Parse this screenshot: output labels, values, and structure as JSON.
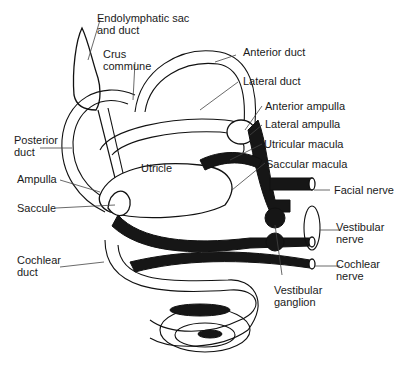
{
  "figure": {
    "labels": {
      "endolymphatic_sac": "Endolymphatic sac\nand duct",
      "crus_commune": "Crus\ncommune",
      "anterior_duct": "Anterior duct",
      "lateral_duct": "Lateral duct",
      "anterior_ampulla": "Anterior ampulla",
      "lateral_ampulla": "Lateral ampulla",
      "utricular_macula": "Utricular macula",
      "saccular_macula": "Saccular macula",
      "facial_nerve": "Facial nerve",
      "vestibular_nerve": "Vestibular\nnerve",
      "cochlear_nerve": "Cochlear\nnerve",
      "vestibular_ganglion": "Vestibular\nganglion",
      "posterior_duct": "Posterior\nduct",
      "utricle": "Utricle",
      "ampulla": "Ampulla",
      "saccule": "Saccule",
      "cochlear_duct": "Cochlear\nduct"
    },
    "colors": {
      "ink": "#111111",
      "background": "#ffffff",
      "label_text": "#1a1a1a"
    }
  }
}
